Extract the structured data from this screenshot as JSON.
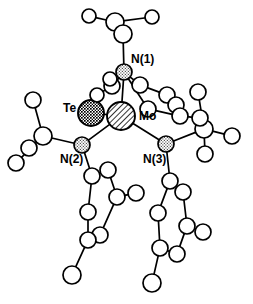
{
  "figure": {
    "type": "crystal-structure-ortep-diagram",
    "caption_text": "",
    "background_color": "#ffffff",
    "line_color": "#000000",
    "width": 253,
    "height": 304
  },
  "labels": {
    "te": "Te",
    "mo": "Mo",
    "n1": "N(1)",
    "n2": "N(2)",
    "n3": "N(3)"
  },
  "atom_styles": {
    "tellurium": {
      "name": "Te",
      "fill_pattern": "dense-crosshatch",
      "color": "#1a1a1a",
      "radius": 13
    },
    "molybdenum": {
      "name": "Mo",
      "fill_pattern": "diagonal-hatch",
      "color": "#000000",
      "radius": 14
    },
    "nitrogen": {
      "name": "N",
      "fill_pattern": "stipple-dots",
      "color": "#6b6b6b",
      "radius": 8
    },
    "carbon": {
      "name": "C",
      "fill_pattern": "open-white",
      "color": "#ffffff",
      "radius": 8
    },
    "hydrogen": {
      "name": "H",
      "fill_pattern": "open-white",
      "color": "#ffffff",
      "radius": 7
    }
  },
  "chart_data": {
    "type": "scatter",
    "title": "",
    "xlabel": "",
    "ylabel": "",
    "atoms": [
      {
        "id": "Te",
        "element": "Te",
        "x": 91,
        "y": 113,
        "r": 13,
        "style": "tellurium"
      },
      {
        "id": "Mo",
        "element": "Mo",
        "x": 121,
        "y": 116,
        "r": 14,
        "style": "molybdenum"
      },
      {
        "id": "N1",
        "element": "N",
        "x": 124,
        "y": 72,
        "r": 8,
        "style": "nitrogen"
      },
      {
        "id": "N2",
        "element": "N",
        "x": 82,
        "y": 145,
        "r": 8,
        "style": "nitrogen"
      },
      {
        "id": "N3",
        "element": "N",
        "x": 166,
        "y": 144,
        "r": 8,
        "style": "nitrogen"
      },
      {
        "id": "C1",
        "element": "C",
        "x": 115,
        "y": 22,
        "r": 9,
        "style": "carbon"
      },
      {
        "id": "C1a",
        "element": "C",
        "x": 123,
        "y": 34,
        "r": 9,
        "style": "carbon"
      },
      {
        "id": "H1a",
        "element": "H",
        "x": 89,
        "y": 16,
        "r": 7,
        "style": "hydrogen"
      },
      {
        "id": "H1b",
        "element": "H",
        "x": 152,
        "y": 17,
        "r": 7,
        "style": "hydrogen"
      },
      {
        "id": "C2",
        "element": "C",
        "x": 112,
        "y": 86,
        "r": 8,
        "style": "carbon"
      },
      {
        "id": "C3",
        "element": "C",
        "x": 140,
        "y": 85,
        "r": 8,
        "style": "carbon"
      },
      {
        "id": "H2a",
        "element": "H",
        "x": 97,
        "y": 95,
        "r": 7,
        "style": "hydrogen"
      },
      {
        "id": "H2b",
        "element": "H",
        "x": 110,
        "y": 79,
        "r": 7,
        "style": "hydrogen"
      },
      {
        "id": "C4",
        "element": "C",
        "x": 167,
        "y": 95,
        "r": 8,
        "style": "carbon"
      },
      {
        "id": "C5",
        "element": "C",
        "x": 176,
        "y": 105,
        "r": 8,
        "style": "carbon"
      },
      {
        "id": "C6",
        "element": "C",
        "x": 148,
        "y": 109,
        "r": 8,
        "style": "carbon"
      },
      {
        "id": "C7",
        "element": "C",
        "x": 180,
        "y": 116,
        "r": 8,
        "style": "carbon"
      },
      {
        "id": "C8",
        "element": "C",
        "x": 204,
        "y": 129,
        "r": 9,
        "style": "carbon"
      },
      {
        "id": "C8a",
        "element": "C",
        "x": 200,
        "y": 118,
        "r": 8,
        "style": "carbon"
      },
      {
        "id": "H8a",
        "element": "H",
        "x": 198,
        "y": 92,
        "r": 8,
        "style": "hydrogen"
      },
      {
        "id": "H8b",
        "element": "H",
        "x": 232,
        "y": 136,
        "r": 8,
        "style": "hydrogen"
      },
      {
        "id": "H8c",
        "element": "H",
        "x": 205,
        "y": 154,
        "r": 8,
        "style": "hydrogen"
      },
      {
        "id": "C9",
        "element": "C",
        "x": 43,
        "y": 136,
        "r": 9,
        "style": "carbon"
      },
      {
        "id": "H9a",
        "element": "H",
        "x": 33,
        "y": 100,
        "r": 8,
        "style": "hydrogen"
      },
      {
        "id": "H9b",
        "element": "H",
        "x": 29,
        "y": 148,
        "r": 8,
        "style": "hydrogen"
      },
      {
        "id": "H9c",
        "element": "H",
        "x": 16,
        "y": 163,
        "r": 8,
        "style": "hydrogen"
      },
      {
        "id": "L1",
        "element": "C",
        "x": 92,
        "y": 176,
        "r": 8,
        "style": "carbon"
      },
      {
        "id": "L2",
        "element": "C",
        "x": 108,
        "y": 170,
        "r": 8,
        "style": "carbon"
      },
      {
        "id": "L3",
        "element": "C",
        "x": 117,
        "y": 197,
        "r": 8,
        "style": "carbon"
      },
      {
        "id": "L4",
        "element": "C",
        "x": 100,
        "y": 235,
        "r": 8,
        "style": "carbon"
      },
      {
        "id": "L5",
        "element": "C",
        "x": 88,
        "y": 240,
        "r": 8,
        "style": "carbon"
      },
      {
        "id": "L6",
        "element": "C",
        "x": 88,
        "y": 212,
        "r": 8,
        "style": "carbon"
      },
      {
        "id": "LH1",
        "element": "H",
        "x": 136,
        "y": 193,
        "r": 8,
        "style": "hydrogen"
      },
      {
        "id": "LH2",
        "element": "H",
        "x": 72,
        "y": 275,
        "r": 9,
        "style": "hydrogen"
      },
      {
        "id": "R1",
        "element": "C",
        "x": 170,
        "y": 181,
        "r": 8,
        "style": "carbon"
      },
      {
        "id": "R2",
        "element": "C",
        "x": 183,
        "y": 192,
        "r": 8,
        "style": "carbon"
      },
      {
        "id": "R3",
        "element": "C",
        "x": 187,
        "y": 226,
        "r": 8,
        "style": "carbon"
      },
      {
        "id": "R4",
        "element": "C",
        "x": 177,
        "y": 254,
        "r": 8,
        "style": "carbon"
      },
      {
        "id": "R5",
        "element": "C",
        "x": 160,
        "y": 248,
        "r": 8,
        "style": "carbon"
      },
      {
        "id": "R6",
        "element": "C",
        "x": 158,
        "y": 213,
        "r": 8,
        "style": "carbon"
      },
      {
        "id": "RH1",
        "element": "H",
        "x": 203,
        "y": 232,
        "r": 8,
        "style": "hydrogen"
      },
      {
        "id": "RH2",
        "element": "H",
        "x": 152,
        "y": 283,
        "r": 9,
        "style": "hydrogen"
      }
    ],
    "bonds": [
      [
        "Te",
        "Mo"
      ],
      [
        "Mo",
        "N1"
      ],
      [
        "Mo",
        "N2"
      ],
      [
        "Mo",
        "N3"
      ],
      [
        "N1",
        "C1a"
      ],
      [
        "C1",
        "C1a"
      ],
      [
        "C1",
        "H1a"
      ],
      [
        "C1",
        "H1b"
      ],
      [
        "N1",
        "C2"
      ],
      [
        "C2",
        "H2a"
      ],
      [
        "C2",
        "H2b"
      ],
      [
        "N1",
        "C3"
      ],
      [
        "C3",
        "C4"
      ],
      [
        "C4",
        "C5"
      ],
      [
        "C5",
        "C7"
      ],
      [
        "N1",
        "C6"
      ],
      [
        "C6",
        "C7"
      ],
      [
        "C7",
        "C8a"
      ],
      [
        "C8",
        "C8a"
      ],
      [
        "C8",
        "H8a"
      ],
      [
        "C8",
        "H8b"
      ],
      [
        "C8",
        "H8c"
      ],
      [
        "C8",
        "N3"
      ],
      [
        "N2",
        "C9"
      ],
      [
        "C9",
        "H9a"
      ],
      [
        "C9",
        "H9b"
      ],
      [
        "C9",
        "H9c"
      ],
      [
        "N2",
        "L1"
      ],
      [
        "L1",
        "L2"
      ],
      [
        "L2",
        "L3"
      ],
      [
        "L3",
        "L4"
      ],
      [
        "L4",
        "L5"
      ],
      [
        "L5",
        "L6"
      ],
      [
        "L6",
        "L1"
      ],
      [
        "L3",
        "LH1"
      ],
      [
        "L5",
        "LH2"
      ],
      [
        "N3",
        "R1"
      ],
      [
        "R1",
        "R2"
      ],
      [
        "R2",
        "R3"
      ],
      [
        "R3",
        "R4"
      ],
      [
        "R4",
        "R5"
      ],
      [
        "R5",
        "R6"
      ],
      [
        "R6",
        "R1"
      ],
      [
        "R3",
        "RH1"
      ],
      [
        "R5",
        "RH2"
      ]
    ],
    "label_positions": [
      {
        "key": "te",
        "x": 63,
        "y": 112,
        "anchor": "start"
      },
      {
        "key": "mo",
        "x": 139,
        "y": 120,
        "anchor": "start"
      },
      {
        "key": "n1",
        "x": 131,
        "y": 63,
        "anchor": "start"
      },
      {
        "key": "n2",
        "x": 60,
        "y": 163,
        "anchor": "start"
      },
      {
        "key": "n3",
        "x": 143,
        "y": 163,
        "anchor": "start"
      }
    ]
  }
}
